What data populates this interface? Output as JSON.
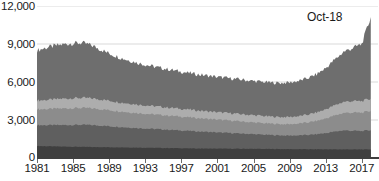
{
  "chart_data": {
    "type": "area",
    "stacked": true,
    "title": "",
    "xlabel": "",
    "ylabel": "",
    "ylim": [
      0,
      12000
    ],
    "xlim": [
      1981,
      2018.8
    ],
    "grid": true,
    "grid_color": "#d9d9d9",
    "legend": null,
    "y_ticks": [
      0,
      3000,
      6000,
      9000,
      12000
    ],
    "y_tick_labels": [
      "0",
      "3,000",
      "6,000",
      "9,000",
      "12,000"
    ],
    "x_ticks": [
      1981,
      1985,
      1989,
      1993,
      1997,
      2001,
      2005,
      2009,
      2013,
      2017
    ],
    "x_tick_labels": [
      "1981",
      "1985",
      "1989",
      "1993",
      "1997",
      "2001",
      "2005",
      "2009",
      "2013",
      "2017"
    ],
    "annotations": [
      {
        "text": "Oct-18",
        "x": 2017.6,
        "y": 11400
      }
    ],
    "series": [
      {
        "name": "series-1",
        "color": "#3f3f3f",
        "values": [
          950,
          930,
          915,
          900,
          890,
          880,
          870,
          860,
          850,
          840,
          830,
          820,
          810,
          800,
          790,
          780,
          770,
          760,
          750,
          745,
          740,
          735,
          730,
          725,
          720,
          715,
          710,
          705,
          700,
          695,
          690,
          688,
          685,
          682,
          680,
          678,
          676,
          674
        ]
      },
      {
        "name": "series-2",
        "color": "#5f5f5f",
        "values": [
          1640,
          1660,
          1680,
          1700,
          1720,
          1740,
          1730,
          1700,
          1660,
          1620,
          1580,
          1550,
          1520,
          1490,
          1460,
          1430,
          1400,
          1370,
          1340,
          1310,
          1280,
          1250,
          1220,
          1190,
          1160,
          1130,
          1100,
          1080,
          1070,
          1090,
          1130,
          1190,
          1280,
          1400,
          1500,
          1470,
          1450,
          1520
        ]
      },
      {
        "name": "series-3",
        "color": "#8c8c8c",
        "values": [
          1260,
          1270,
          1290,
          1310,
          1320,
          1330,
          1320,
          1300,
          1270,
          1240,
          1210,
          1190,
          1170,
          1150,
          1130,
          1110,
          1090,
          1070,
          1050,
          1030,
          1010,
          990,
          970,
          950,
          930,
          910,
          900,
          890,
          900,
          930,
          980,
          1050,
          1150,
          1270,
          1380,
          1430,
          1450,
          1520
        ]
      },
      {
        "name": "series-4",
        "color": "#adadad",
        "values": [
          700,
          720,
          745,
          770,
          790,
          800,
          790,
          770,
          745,
          720,
          700,
          680,
          665,
          650,
          640,
          630,
          620,
          610,
          600,
          595,
          590,
          585,
          580,
          575,
          570,
          565,
          560,
          560,
          570,
          590,
          620,
          665,
          730,
          810,
          880,
          910,
          920,
          960
        ]
      },
      {
        "name": "series-5",
        "color": "#6e6e6e",
        "values": [
          3950,
          4120,
          4230,
          4300,
          4340,
          4330,
          4200,
          3950,
          3730,
          3560,
          3420,
          3300,
          3200,
          3120,
          3050,
          2990,
          2930,
          2880,
          2840,
          2810,
          2780,
          2760,
          2740,
          2720,
          2700,
          2690,
          2680,
          2690,
          2720,
          2780,
          2880,
          3020,
          3250,
          3600,
          3950,
          4200,
          4500,
          6450
        ]
      }
    ],
    "x": [
      1981,
      1982,
      1983,
      1984,
      1985,
      1986,
      1987,
      1988,
      1989,
      1990,
      1991,
      1992,
      1993,
      1994,
      1995,
      1996,
      1997,
      1998,
      1999,
      2000,
      2001,
      2002,
      2003,
      2004,
      2005,
      2006,
      2007,
      2008,
      2009,
      2010,
      2011,
      2012,
      2013,
      2014,
      2015,
      2016,
      2017,
      2018
    ]
  }
}
